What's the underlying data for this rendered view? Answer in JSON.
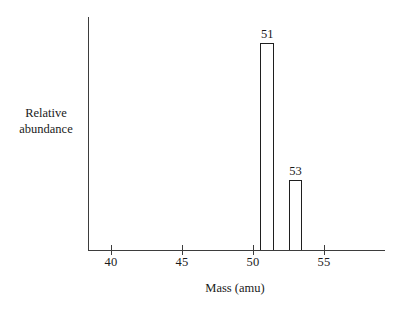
{
  "chart_data": {
    "type": "bar",
    "title": "",
    "xlabel": "Mass (amu)",
    "ylabel_line1": "Relative",
    "ylabel_line2": "abundance",
    "xlim": [
      38.5,
      59.3
    ],
    "ylim": [
      0,
      100
    ],
    "grid": false,
    "legend": "none",
    "axis_color": "#3d3d3d",
    "bar_outline_color": "#1f1f1f",
    "bar_fill_color": "#ffffff",
    "xticks": [
      {
        "value": 40,
        "label": "40"
      },
      {
        "value": 45,
        "label": "45"
      },
      {
        "value": 50,
        "label": "50"
      },
      {
        "value": 55,
        "label": "55"
      }
    ],
    "yticks": [],
    "categories": [
      51,
      53
    ],
    "values": [
      100,
      34
    ],
    "bars": [
      {
        "x": 51,
        "label": "51",
        "relative_abundance": 100
      },
      {
        "x": 53,
        "label": "53",
        "relative_abundance": 34
      }
    ]
  }
}
